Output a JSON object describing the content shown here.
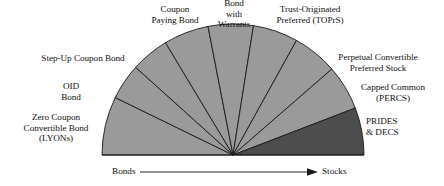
{
  "figure": {
    "geometry": {
      "center_x": 233,
      "center_y": 155,
      "radius": 131,
      "baseline_left_x": 102,
      "baseline_right_x": 364,
      "baseline_y": 155
    },
    "colors": {
      "light_wedge": "#9a9a9a",
      "dark_wedge": "#4d4d4d",
      "outline": "#1a1a1a",
      "background": "#ffffff",
      "text": "#111111",
      "axis": "#2a2a2a"
    }
  },
  "chart_data": {
    "type": "pie",
    "subtype": "semicircular fan / spectrum",
    "total_sweep_degrees": 180,
    "orientation": "semicircle opening upward, swept left (Bonds) to right (Stocks)",
    "categories": [
      "Zero Coupon Convertible Bond (LYONs)",
      "OID Bond",
      "Step-Up Coupon Bond",
      "Coupon Paying Bond",
      "Bond with Warrants",
      "Trust-Originated Preferred (TOPrS)",
      "Perpetual Convertible Preferred Stock",
      "Capped Common (PERCS)",
      "PRIDES & DECS"
    ],
    "values": [
      26,
      16,
      17,
      20,
      20,
      20,
      20,
      20,
      21
    ],
    "wedge_angles_degrees": [
      {
        "name": "Zero Coupon Convertible Bond (LYONs)",
        "start": 180,
        "end": 154,
        "sweep": 26,
        "shade": "light"
      },
      {
        "name": "OID Bond",
        "start": 154,
        "end": 138,
        "sweep": 16,
        "shade": "light"
      },
      {
        "name": "Step-Up Coupon Bond",
        "start": 138,
        "end": 121,
        "sweep": 17,
        "shade": "light"
      },
      {
        "name": "Coupon Paying Bond",
        "start": 121,
        "end": 101,
        "sweep": 20,
        "shade": "light"
      },
      {
        "name": "Bond with Warrants",
        "start": 101,
        "end": 81,
        "sweep": 20,
        "shade": "light"
      },
      {
        "name": "Trust-Originated Preferred (TOPrS)",
        "start": 81,
        "end": 61,
        "sweep": 20,
        "shade": "light"
      },
      {
        "name": "Perpetual Convertible Preferred Stock",
        "start": 61,
        "end": 41,
        "sweep": 20,
        "shade": "light"
      },
      {
        "name": "Capped Common (PERCS)",
        "start": 41,
        "end": 21,
        "sweep": 20,
        "shade": "light"
      },
      {
        "name": "PRIDES & DECS",
        "start": 21,
        "end": 0,
        "sweep": 21,
        "shade": "dark"
      }
    ],
    "xlabel": "",
    "ylabel": "",
    "legend": "none",
    "grid": false,
    "annotations": [
      {
        "text": "Bonds",
        "position": "axis-left"
      },
      {
        "text": "Stocks",
        "position": "axis-right"
      },
      {
        "text": "arrow pointing left to right",
        "position": "axis-center"
      }
    ]
  },
  "labels": {
    "coupon_paying_bond": "Coupon\nPaying Bond",
    "bond_with_warrants": "Bond\nwith\nWarrants",
    "trust_originated_preferred": "Trust-Originated\nPreferred  (TOPrS)",
    "step_up_coupon_bond": "Step-Up Coupon Bond",
    "perpetual_convertible": "Perpetual Convertible\nPreferred Stock",
    "oid_bond": "OID\nBond",
    "capped_common": "Capped Common\n(PERCS)",
    "zero_coupon_convertible": "Zero Coupon\nConvertible Bond\n(LYONs)",
    "prides_decs": "PRIDES\n& DECS"
  },
  "axis": {
    "left_label": "Bonds",
    "right_label": "Stocks"
  }
}
